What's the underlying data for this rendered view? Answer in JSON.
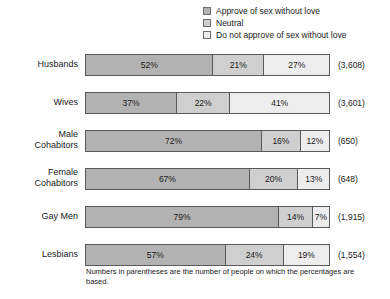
{
  "legend": {
    "items": [
      {
        "label": "Approve of sex without love",
        "swatch": "legend-swatch-approve",
        "color": "#b2b2b2"
      },
      {
        "label": "Neutral",
        "swatch": "legend-swatch-neutral",
        "color": "#cfcfcf"
      },
      {
        "label": "Do not approve of sex without love",
        "swatch": "legend-swatch-disapprove",
        "color": "#ededed"
      }
    ]
  },
  "footnote": "Numbers in parentheses are the number of people on which the percentages are based.",
  "chart_data": {
    "type": "bar",
    "title": "",
    "subtitle": "",
    "xlabel": "",
    "ylabel": "",
    "orientation": "horizontal",
    "stacked": true,
    "stack_total": 100,
    "xlim": [
      0,
      100
    ],
    "grid": false,
    "legend_position": "top-right",
    "value_suffix": "%",
    "categories": [
      "Husbands",
      "Wives",
      "Male Cohabitors",
      "Female Cohabitors",
      "Gay Men",
      "Lesbians"
    ],
    "series": [
      {
        "name": "Approve of sex without love",
        "color": "#b2b2b2",
        "values": [
          52,
          37,
          72,
          67,
          79,
          57
        ]
      },
      {
        "name": "Neutral",
        "color": "#cfcfcf",
        "values": [
          21,
          22,
          16,
          20,
          14,
          24
        ]
      },
      {
        "name": "Do not approve of sex without love",
        "color": "#ededed",
        "values": [
          27,
          41,
          12,
          13,
          7,
          19
        ]
      }
    ],
    "sample_sizes": [
      "(3,608)",
      "(3,601)",
      "(650)",
      "(648)",
      "(1,915)",
      "(1,554)"
    ],
    "annotations": [
      "Numbers in parentheses are the number of people on which the percentages are based."
    ]
  },
  "rows": [
    {
      "label": "Husbands",
      "n": "(3,608)",
      "segments": [
        {
          "value": "52%",
          "pct": 52,
          "kind": "approve"
        },
        {
          "value": "21%",
          "pct": 21,
          "kind": "neutral"
        },
        {
          "value": "27%",
          "pct": 27,
          "kind": "disapprove"
        }
      ]
    },
    {
      "label": "Wives",
      "n": "(3,601)",
      "segments": [
        {
          "value": "37%",
          "pct": 37,
          "kind": "approve"
        },
        {
          "value": "22%",
          "pct": 22,
          "kind": "neutral"
        },
        {
          "value": "41%",
          "pct": 41,
          "kind": "disapprove"
        }
      ]
    },
    {
      "label": "Male\nCohabitors",
      "n": "(650)",
      "segments": [
        {
          "value": "72%",
          "pct": 72,
          "kind": "approve"
        },
        {
          "value": "16%",
          "pct": 16,
          "kind": "neutral"
        },
        {
          "value": "12%",
          "pct": 12,
          "kind": "disapprove"
        }
      ]
    },
    {
      "label": "Female\nCohabitors",
      "n": "(648)",
      "segments": [
        {
          "value": "67%",
          "pct": 67,
          "kind": "approve"
        },
        {
          "value": "20%",
          "pct": 20,
          "kind": "neutral"
        },
        {
          "value": "13%",
          "pct": 13,
          "kind": "disapprove"
        }
      ]
    },
    {
      "label": "Gay Men",
      "n": "(1,915)",
      "segments": [
        {
          "value": "79%",
          "pct": 79,
          "kind": "approve"
        },
        {
          "value": "14%",
          "pct": 14,
          "kind": "neutral"
        },
        {
          "value": "7%",
          "pct": 7,
          "kind": "disapprove"
        }
      ]
    },
    {
      "label": "Lesbians",
      "n": "(1,554)",
      "segments": [
        {
          "value": "57%",
          "pct": 57,
          "kind": "approve"
        },
        {
          "value": "24%",
          "pct": 24,
          "kind": "neutral"
        },
        {
          "value": "19%",
          "pct": 19,
          "kind": "disapprove"
        }
      ]
    }
  ]
}
